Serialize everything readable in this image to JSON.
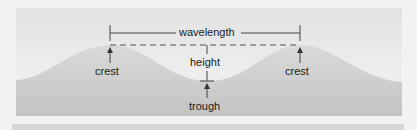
{
  "diagram": {
    "labels": {
      "wavelength": "wavelength",
      "height": "height",
      "crest_left": "crest",
      "crest_right": "crest",
      "trough": "trough"
    },
    "colors": {
      "background": "#f2f2f2",
      "panel_top": "#e2e2e2",
      "panel_bottom": "#f0f0f0",
      "wave_fill_top": "#d9d9d9",
      "wave_fill_bottom": "#c4c4c4",
      "line": "#444444",
      "text": "#1a1a1a",
      "strip": "#d6d6d6"
    }
  }
}
